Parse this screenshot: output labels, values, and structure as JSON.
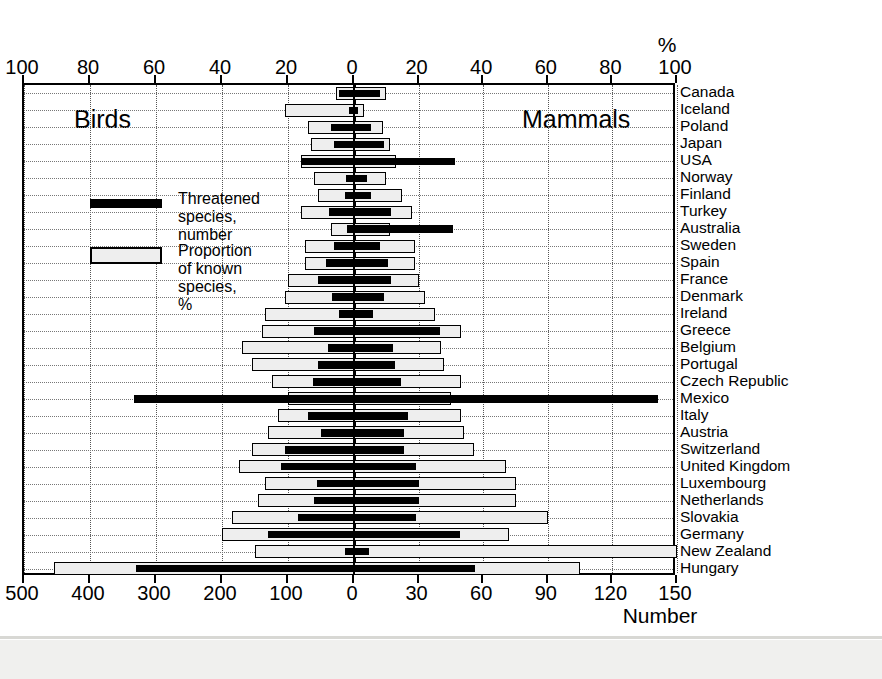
{
  "chart_data": {
    "type": "bar",
    "title": "",
    "subtitle": "",
    "orientation": "horizontal-diverging",
    "left_side_label": "Birds",
    "right_side_label": "Mammals",
    "top_axis_label": "%",
    "bottom_axis_label": "Number",
    "top_axis_ticks_left": [
      100,
      80,
      60,
      40,
      20,
      0
    ],
    "top_axis_ticks_right": [
      20,
      40,
      60,
      80,
      100
    ],
    "bottom_axis_ticks_left": [
      500,
      400,
      300,
      200,
      100,
      0
    ],
    "bottom_axis_ticks_right": [
      30,
      60,
      90,
      120,
      150
    ],
    "left_pct_max": 100,
    "right_pct_max": 100,
    "left_num_max": 500,
    "right_num_max": 150,
    "grid": true,
    "legend_position": "inside-left",
    "legend": [
      {
        "key": "number",
        "label": "Threatened species,\nnumber",
        "style": "black-bar"
      },
      {
        "key": "proportion",
        "label": "Proportion of known\nspecies, %",
        "style": "outlined-bar"
      }
    ],
    "categories": [
      "Canada",
      "Iceland",
      "Poland",
      "Japan",
      "USA",
      "Norway",
      "Finland",
      "Turkey",
      "Australia",
      "Sweden",
      "Spain",
      "France",
      "Denmark",
      "Ireland",
      "Greece",
      "Belgium",
      "Portugal",
      "Czech Republic",
      "Mexico",
      "Italy",
      "Austria",
      "Switzerland",
      "United Kingdom",
      "Luxembourg",
      "Netherlands",
      "Slovakia",
      "Germany",
      "New Zealand",
      "Hungary"
    ],
    "series": [
      {
        "name": "Birds - Proportion of known species, %",
        "side": "left",
        "style": "outlined-bar",
        "unit": "%",
        "values": [
          5.5,
          21,
          14,
          13,
          16,
          12,
          11,
          16,
          7,
          15,
          15,
          20,
          21,
          27,
          28,
          34,
          31,
          25,
          20,
          23,
          26,
          31,
          35,
          27,
          29,
          37,
          40,
          30,
          91
        ]
      },
      {
        "name": "Birds - Threatened species, number",
        "side": "left",
        "style": "black-bar",
        "unit": "number",
        "values": [
          22,
          8,
          35,
          30,
          80,
          12,
          14,
          38,
          10,
          30,
          42,
          55,
          34,
          22,
          60,
          40,
          55,
          62,
          333,
          70,
          50,
          105,
          110,
          56,
          60,
          85,
          130,
          14,
          330
        ]
      },
      {
        "name": "Mammals - Proportion of known species, %",
        "side": "right",
        "style": "outlined-bar",
        "unit": "%",
        "values": [
          10,
          3,
          9,
          11,
          13,
          10,
          15,
          18,
          11,
          19,
          19,
          20,
          22,
          25,
          33,
          27,
          28,
          33,
          30,
          33,
          34,
          37,
          47,
          50,
          50,
          60,
          48,
          100,
          70
        ]
      },
      {
        "name": "Mammals - Threatened species, number",
        "side": "right",
        "style": "black-bar",
        "unit": "number",
        "values": [
          12,
          2,
          8,
          14,
          47,
          6,
          8,
          17,
          46,
          12,
          16,
          17,
          14,
          9,
          40,
          18,
          19,
          22,
          141,
          25,
          23,
          23,
          29,
          30,
          30,
          29,
          49,
          7,
          56
        ]
      }
    ],
    "colors": {
      "bar_number": "#000000",
      "bar_proportion_fill": "#eeeeee",
      "bar_proportion_edge": "#000000",
      "axis": "#000000",
      "grid": "#777777"
    }
  },
  "footer": {
    "caption_fragment": ""
  }
}
